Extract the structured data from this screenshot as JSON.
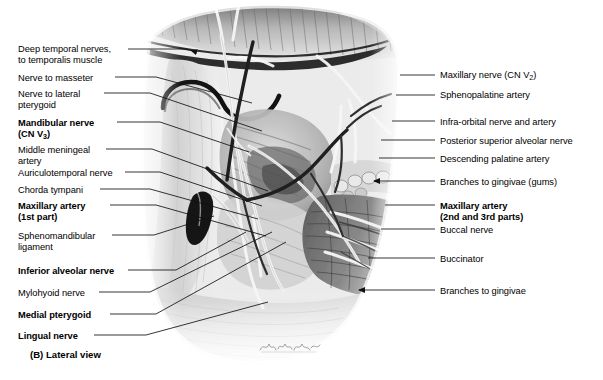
{
  "figure": {
    "caption": "(B) Lateral view",
    "view": "Lateral view",
    "panel_letter": "(B)",
    "signature": "artist-signature"
  },
  "labels_left": [
    {
      "id": "deep-temporal-nerves",
      "line1": "Deep temporal nerves,",
      "line2": "to temporalis muscle",
      "bold": false,
      "x": 18,
      "y": 44,
      "leader_y": 49,
      "leader_x1": 128,
      "leader_x2": 191,
      "arrow": true
    },
    {
      "id": "nerve-to-masseter",
      "line1": "Nerve to masseter",
      "line2": "",
      "bold": false,
      "x": 18,
      "y": 73,
      "leader_y": 77,
      "leader_x1": 115,
      "leader_x2": 226,
      "arrow": false
    },
    {
      "id": "nerve-to-lateral-pterygoid",
      "line1": "Nerve to lateral",
      "line2": "pterygoid",
      "bold": false,
      "x": 18,
      "y": 89,
      "leader_y": 93,
      "leader_x1": 104,
      "leader_x2": 236,
      "arrow": false
    },
    {
      "id": "mandibular-nerve",
      "line1": "Mandibular nerve",
      "line2": "(CN V3)",
      "bold": true,
      "x": 18,
      "y": 118,
      "leader_y": 122,
      "leader_x1": 117,
      "leader_x2": 224,
      "arrow": false
    },
    {
      "id": "middle-meningeal-artery",
      "line1": "Middle meningeal",
      "line2": "artery",
      "bold": false,
      "x": 18,
      "y": 145,
      "leader_y": 149,
      "leader_x1": 106,
      "leader_x2": 252,
      "arrow": false
    },
    {
      "id": "auriculotemporal-nerve",
      "line1": "Auriculotemporal nerve",
      "line2": "",
      "bold": false,
      "x": 18,
      "y": 168,
      "leader_y": 172,
      "leader_x1": 125,
      "leader_x2": 249,
      "arrow": false
    },
    {
      "id": "chorda-tympani",
      "line1": "Chorda tympani",
      "line2": "",
      "bold": false,
      "x": 18,
      "y": 185,
      "leader_y": 189,
      "leader_x1": 100,
      "leader_x2": 243,
      "arrow": false
    },
    {
      "id": "maxillary-artery-1st",
      "line1": "Maxillary artery",
      "line2": "(1st part)",
      "bold": true,
      "x": 18,
      "y": 201,
      "leader_y": 205,
      "leader_x1": 110,
      "leader_x2": 256,
      "arrow": false
    },
    {
      "id": "sphenomandibular-ligament",
      "line1": "Sphenomandibular",
      "line2": "ligament",
      "bold": false,
      "x": 18,
      "y": 231,
      "leader_y": 235,
      "leader_x1": 112,
      "leader_x2": 215,
      "arrow": false
    },
    {
      "id": "inferior-alveolar-nerve",
      "line1": "Inferior alveolar nerve",
      "line2": "",
      "bold": true,
      "x": 18,
      "y": 266,
      "leader_y": 270,
      "leader_x1": 128,
      "leader_x2": 236,
      "arrow": false
    },
    {
      "id": "mylohyoid-nerve",
      "line1": "Mylohyoid nerve",
      "line2": "",
      "bold": false,
      "x": 18,
      "y": 288,
      "leader_y": 292,
      "leader_x1": 99,
      "leader_x2": 272,
      "arrow": false
    },
    {
      "id": "medial-pterygoid",
      "line1": "Medial pterygoid",
      "line2": "",
      "bold": true,
      "x": 18,
      "y": 310,
      "leader_y": 314,
      "leader_x1": 110,
      "leader_x2": 290,
      "arrow": false
    },
    {
      "id": "lingual-nerve",
      "line1": "Lingual nerve",
      "line2": "",
      "bold": true,
      "x": 18,
      "y": 331,
      "leader_y": 335,
      "leader_x1": 94,
      "leader_x2": 266,
      "arrow": false
    }
  ],
  "labels_right": [
    {
      "id": "maxillary-nerve",
      "line1": "Maxillary nerve (CN V2)",
      "line2": "",
      "bold": false,
      "x": 440,
      "y": 70,
      "leader_y": 75,
      "leader_x1": 400,
      "leader_x2": 435,
      "arrow": false
    },
    {
      "id": "sphenopalatine-artery",
      "line1": "Sphenopalatine artery",
      "line2": "",
      "bold": false,
      "x": 440,
      "y": 90,
      "leader_y": 95,
      "leader_x1": 396,
      "leader_x2": 435,
      "arrow": false
    },
    {
      "id": "infra-orbital-nerve-and-artery",
      "line1": "Infra-orbital nerve and artery",
      "line2": "",
      "bold": false,
      "x": 440,
      "y": 117,
      "leader_y": 121,
      "leader_x1": 392,
      "leader_x2": 435,
      "arrow": false
    },
    {
      "id": "posterior-superior-alveolar-nerve",
      "line1": "Posterior superior alveolar nerve",
      "line2": "",
      "bold": false,
      "x": 440,
      "y": 136,
      "leader_y": 140,
      "leader_x1": 381,
      "leader_x2": 435,
      "arrow": false
    },
    {
      "id": "descending-palatine-artery",
      "line1": "Descending palatine artery",
      "line2": "",
      "bold": false,
      "x": 440,
      "y": 154,
      "leader_y": 158,
      "leader_x1": 379,
      "leader_x2": 435,
      "arrow": false
    },
    {
      "id": "branches-to-gingivae-gums",
      "line1": "Branches to gingivae (gums)",
      "line2": "",
      "bold": false,
      "x": 440,
      "y": 177,
      "leader_y": 181,
      "leader_x1": 374,
      "leader_x2": 435,
      "arrow": true
    },
    {
      "id": "maxillary-artery-2nd-3rd",
      "line1": "Maxillary artery",
      "line2": "(2nd and 3rd parts)",
      "bold": true,
      "x": 440,
      "y": 201,
      "leader_y": 205,
      "leader_x1": 385,
      "leader_x2": 435,
      "arrow": false
    },
    {
      "id": "buccal-nerve",
      "line1": "Buccal nerve",
      "line2": "",
      "bold": false,
      "x": 440,
      "y": 225,
      "leader_y": 229,
      "leader_x1": 381,
      "leader_x2": 435,
      "arrow": false
    },
    {
      "id": "buccinator",
      "line1": "Buccinator",
      "line2": "",
      "bold": false,
      "x": 440,
      "y": 254,
      "leader_y": 258,
      "leader_x1": 368,
      "leader_x2": 435,
      "arrow": false
    },
    {
      "id": "branches-to-gingivae",
      "line1": "Branches to gingivae",
      "line2": "",
      "bold": false,
      "x": 440,
      "y": 286,
      "leader_y": 290,
      "leader_x1": 359,
      "leader_x2": 435,
      "arrow": true
    }
  ],
  "colors": {
    "text": "#000000",
    "leader": "#1a1a1a",
    "background": "#ffffff",
    "illustration_tone": "#9a9a9a"
  }
}
